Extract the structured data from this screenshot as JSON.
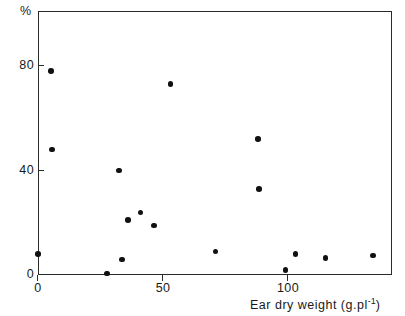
{
  "chart_data": {
    "type": "scatter",
    "title": "",
    "xlabel": "Ear dry weight (g.pl−1)",
    "xlabel_base": "Ear dry weight (g.pl",
    "xlabel_exponent": "-1",
    "xlabel_tail": ")",
    "ylabel": "%",
    "xlim": [
      -2,
      140
    ],
    "ylim": [
      -2,
      101
    ],
    "xticks": [
      0,
      50,
      100
    ],
    "xticklabels": [
      "0",
      "50",
      "100"
    ],
    "yticks": [
      0,
      40,
      80
    ],
    "yticklabels": [
      "0",
      "40",
      "80"
    ],
    "grid": false,
    "legend": null,
    "marker": "filled-circle",
    "marker_color": "#111111",
    "frame_color": "#2b2b2b",
    "background": "#ffffff",
    "points": [
      {
        "x": 0,
        "y": 8
      },
      {
        "x": 5.2,
        "y": 78
      },
      {
        "x": 5.6,
        "y": 48
      },
      {
        "x": 27.5,
        "y": 0.5
      },
      {
        "x": 32.5,
        "y": 40
      },
      {
        "x": 33.5,
        "y": 6
      },
      {
        "x": 36,
        "y": 21
      },
      {
        "x": 41,
        "y": 24
      },
      {
        "x": 46.5,
        "y": 19
      },
      {
        "x": 53,
        "y": 73
      },
      {
        "x": 71,
        "y": 9
      },
      {
        "x": 88,
        "y": 52
      },
      {
        "x": 88.5,
        "y": 33
      },
      {
        "x": 99,
        "y": 2
      },
      {
        "x": 103,
        "y": 8
      },
      {
        "x": 115,
        "y": 6.5
      },
      {
        "x": 134,
        "y": 7.5
      }
    ]
  }
}
